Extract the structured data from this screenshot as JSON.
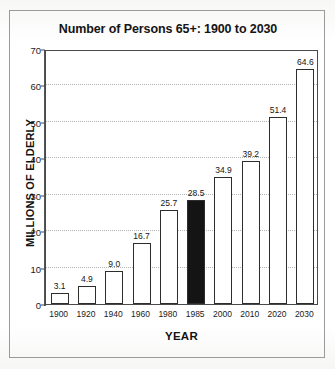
{
  "chart_data": {
    "type": "bar",
    "title": "Number of Persons 65+: 1900 to 2030",
    "xlabel": "YEAR",
    "ylabel": "MILLIONS OF ELDERLY",
    "categories": [
      "1900",
      "1920",
      "1940",
      "1960",
      "1980",
      "1985",
      "2000",
      "2010",
      "2020",
      "2030"
    ],
    "values": [
      3.1,
      4.9,
      9.0,
      16.7,
      25.7,
      28.5,
      34.9,
      39.2,
      51.4,
      64.6
    ],
    "value_labels": [
      "3.1",
      "4.9",
      "9.0",
      "16.7",
      "25.7",
      "28.5",
      "34.9",
      "39.2",
      "51.4",
      "64.6"
    ],
    "highlighted_category": "1985",
    "highlight_color": "#141414",
    "bar_color": "#ffffff",
    "bar_edge_color": "#2d2d2d",
    "ylim": [
      0,
      70
    ],
    "yticks": [
      0,
      10,
      20,
      30,
      40,
      50,
      60,
      70
    ],
    "ytick_labels": [
      "0",
      "10",
      "20",
      "30",
      "40",
      "50",
      "60",
      "70"
    ],
    "grid": true,
    "grid_style": "dotted",
    "grid_color": "#b4b4b4",
    "legend": null,
    "legend_position": "none"
  }
}
